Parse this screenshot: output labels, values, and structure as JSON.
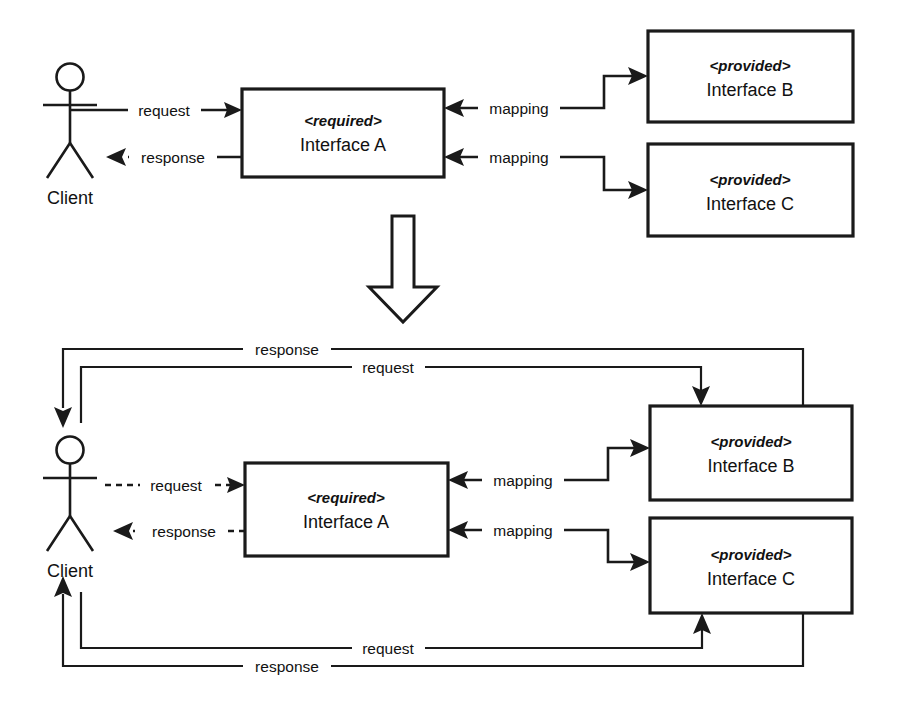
{
  "diagram": {
    "colors": {
      "stroke": "#1a1a1a",
      "text": "#111111",
      "background": "#ffffff"
    },
    "top_panel": {
      "actor": {
        "label": "Client",
        "icon": "stick-figure-actor-icon"
      },
      "boxes": [
        {
          "id": "interface-a",
          "stereotype": "<required>",
          "name": "Interface A"
        },
        {
          "id": "interface-b",
          "stereotype": "<provided>",
          "name": "Interface B"
        },
        {
          "id": "interface-c",
          "stereotype": "<provided>",
          "name": "Interface C"
        }
      ],
      "edges": [
        {
          "id": "client-request",
          "label": "request",
          "style": "solid",
          "from": "Client",
          "to": "Interface A"
        },
        {
          "id": "client-response",
          "label": "response",
          "style": "solid",
          "from": "Interface A",
          "to": "Client"
        },
        {
          "id": "mapping-b",
          "label": "mapping",
          "style": "solid",
          "from": "Interface B",
          "to": "Interface A"
        },
        {
          "id": "mapping-c",
          "label": "mapping",
          "style": "solid",
          "from": "Interface C",
          "to": "Interface A"
        }
      ]
    },
    "transform_arrow": {
      "icon": "block-arrow-down-icon",
      "direction": "down"
    },
    "bottom_panel": {
      "actor": {
        "label": "Client",
        "icon": "stick-figure-actor-icon"
      },
      "boxes": [
        {
          "id": "interface-a",
          "stereotype": "<required>",
          "name": "Interface A"
        },
        {
          "id": "interface-b",
          "stereotype": "<provided>",
          "name": "Interface B"
        },
        {
          "id": "interface-c",
          "stereotype": "<provided>",
          "name": "Interface C"
        }
      ],
      "edges": [
        {
          "id": "client-request-dashed",
          "label": "request",
          "style": "dashed",
          "from": "Client",
          "to": "Interface A"
        },
        {
          "id": "client-response-dashed",
          "label": "response",
          "style": "dashed",
          "from": "Interface A",
          "to": "Client"
        },
        {
          "id": "mapping-b",
          "label": "mapping",
          "style": "solid",
          "from": "Interface B",
          "to": "Interface A"
        },
        {
          "id": "mapping-c",
          "label": "mapping",
          "style": "solid",
          "from": "Interface C",
          "to": "Interface A"
        },
        {
          "id": "direct-request-b",
          "label": "request",
          "style": "solid",
          "from": "Client",
          "to": "Interface B"
        },
        {
          "id": "direct-response-b",
          "label": "response",
          "style": "solid",
          "from": "Interface B",
          "to": "Client"
        },
        {
          "id": "direct-request-c",
          "label": "request",
          "style": "solid",
          "from": "Client",
          "to": "Interface C"
        },
        {
          "id": "direct-response-c",
          "label": "response",
          "style": "solid",
          "from": "Interface C",
          "to": "Client"
        }
      ]
    }
  }
}
